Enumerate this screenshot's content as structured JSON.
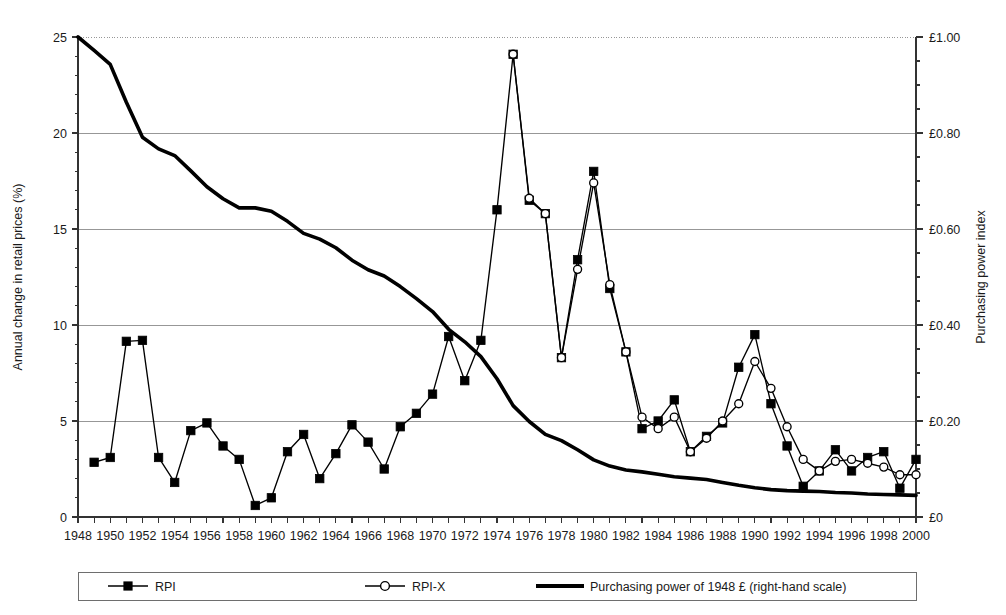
{
  "chart_data": {
    "type": "line",
    "title": "",
    "xlabel": "",
    "ylabel": "Annual change in retail prices (%)",
    "y2label": "Purchasing power index",
    "xlim": [
      1948,
      2000
    ],
    "ylim": [
      0,
      25
    ],
    "y2lim": [
      0,
      1.0
    ],
    "grid": true,
    "legend_position": "bottom",
    "x_tick_labels": [
      "1948",
      "1950",
      "1952",
      "1954",
      "1956",
      "1958",
      "1960",
      "1962",
      "1964",
      "1966",
      "1968",
      "1970",
      "1972",
      "1974",
      "1976",
      "1978",
      "1980",
      "1982",
      "1984",
      "1986",
      "1988",
      "1990",
      "1992",
      "1994",
      "1996",
      "1998",
      "2000"
    ],
    "x_tick_values": [
      1948,
      1950,
      1952,
      1954,
      1956,
      1958,
      1960,
      1962,
      1964,
      1966,
      1968,
      1970,
      1972,
      1974,
      1976,
      1978,
      1980,
      1982,
      1984,
      1986,
      1988,
      1990,
      1992,
      1994,
      1996,
      1998,
      2000
    ],
    "y_tick_labels": [
      "0",
      "5",
      "10",
      "15",
      "20",
      "25"
    ],
    "y_tick_values": [
      0,
      5,
      10,
      15,
      20,
      25
    ],
    "y2_tick_labels": [
      "£0",
      "£0.20",
      "£0.40",
      "£0.60",
      "£0.80",
      "£1.00"
    ],
    "y2_tick_values": [
      0,
      0.2,
      0.4,
      0.6,
      0.8,
      1.0
    ],
    "x_minor_step": 1,
    "y_minor_step": 1,
    "series": [
      {
        "name": "RPI",
        "axis": "left",
        "marker": "filled-square",
        "x": [
          1949,
          1950,
          1951,
          1952,
          1953,
          1954,
          1955,
          1956,
          1957,
          1958,
          1959,
          1960,
          1961,
          1962,
          1963,
          1964,
          1965,
          1966,
          1967,
          1968,
          1969,
          1970,
          1971,
          1972,
          1973,
          1974,
          1975,
          1976,
          1977,
          1978,
          1979,
          1980,
          1981,
          1982,
          1983,
          1984,
          1985,
          1986,
          1987,
          1988,
          1989,
          1990,
          1991,
          1992,
          1993,
          1994,
          1995,
          1996,
          1997,
          1998,
          1999,
          2000
        ],
        "values": [
          2.85,
          3.1,
          9.15,
          9.2,
          3.1,
          1.8,
          4.5,
          4.9,
          3.7,
          3.0,
          0.6,
          1.0,
          3.4,
          4.3,
          2.0,
          3.3,
          4.8,
          3.9,
          2.5,
          4.7,
          5.4,
          6.4,
          9.4,
          7.1,
          9.2,
          16.0,
          24.1,
          16.5,
          15.8,
          8.3,
          13.4,
          18.0,
          11.9,
          8.6,
          4.6,
          5.0,
          6.1,
          3.4,
          4.2,
          4.9,
          7.8,
          9.5,
          5.9,
          3.7,
          1.6,
          2.4,
          3.5,
          2.4,
          3.1,
          3.4,
          1.5,
          3.0
        ]
      },
      {
        "name": "RPI-X",
        "axis": "left",
        "marker": "open-circle",
        "x": [
          1975,
          1976,
          1977,
          1978,
          1979,
          1980,
          1981,
          1982,
          1983,
          1984,
          1985,
          1986,
          1987,
          1988,
          1989,
          1990,
          1991,
          1992,
          1993,
          1994,
          1995,
          1996,
          1997,
          1998,
          1999,
          2000
        ],
        "values": [
          24.1,
          16.6,
          15.8,
          8.3,
          12.9,
          17.4,
          12.1,
          8.6,
          5.2,
          4.6,
          5.2,
          3.4,
          4.1,
          5.0,
          5.9,
          8.1,
          6.7,
          4.7,
          3.0,
          2.4,
          2.9,
          3.0,
          2.8,
          2.6,
          2.2,
          2.2
        ]
      },
      {
        "name": "Purchasing power of 1948 £ (right-hand scale)",
        "axis": "right",
        "marker": "none",
        "x": [
          1948,
          1949,
          1950,
          1951,
          1952,
          1953,
          1954,
          1955,
          1956,
          1957,
          1958,
          1959,
          1960,
          1961,
          1962,
          1963,
          1964,
          1965,
          1966,
          1967,
          1968,
          1969,
          1970,
          1971,
          1972,
          1973,
          1974,
          1975,
          1976,
          1977,
          1978,
          1979,
          1980,
          1981,
          1982,
          1983,
          1984,
          1985,
          1986,
          1987,
          1988,
          1989,
          1990,
          1991,
          1992,
          1993,
          1994,
          1995,
          1996,
          1997,
          1998,
          1999,
          2000
        ],
        "values": [
          1.0,
          0.972,
          0.943,
          0.864,
          0.791,
          0.767,
          0.753,
          0.721,
          0.688,
          0.663,
          0.644,
          0.644,
          0.637,
          0.616,
          0.591,
          0.579,
          0.561,
          0.535,
          0.515,
          0.502,
          0.48,
          0.455,
          0.428,
          0.391,
          0.365,
          0.334,
          0.288,
          0.232,
          0.199,
          0.172,
          0.159,
          0.14,
          0.119,
          0.106,
          0.098,
          0.094,
          0.089,
          0.084,
          0.081,
          0.078,
          0.072,
          0.066,
          0.061,
          0.057,
          0.055,
          0.054,
          0.053,
          0.051,
          0.05,
          0.048,
          0.047,
          0.046,
          0.045
        ]
      }
    ],
    "legend": [
      {
        "label": "RPI",
        "marker": "filled-square"
      },
      {
        "label": "RPI-X",
        "marker": "open-circle"
      },
      {
        "label": "Purchasing power of 1948 £ (right-hand scale)",
        "marker": "thick-line"
      }
    ]
  },
  "colors": {
    "ink": "#000000",
    "grid": "#8c8c8c",
    "axis": "#333333",
    "background": "#ffffff"
  }
}
